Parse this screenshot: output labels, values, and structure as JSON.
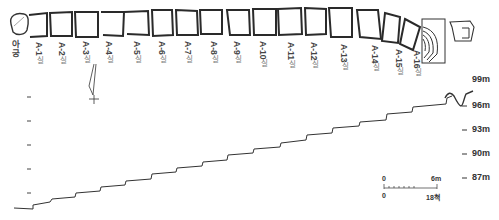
{
  "figure": {
    "type": "kiln plan and longitudinal section",
    "plan": {
      "firebox_label": "아궁",
      "chambers": [
        {
          "id": "A-1",
          "suffix": "실"
        },
        {
          "id": "A-2",
          "suffix": "실"
        },
        {
          "id": "A-3",
          "suffix": "실"
        },
        {
          "id": "A-4",
          "suffix": "실"
        },
        {
          "id": "A-5",
          "suffix": "실"
        },
        {
          "id": "A-6",
          "suffix": "실"
        },
        {
          "id": "A-7",
          "suffix": "실"
        },
        {
          "id": "A-8",
          "suffix": "실"
        },
        {
          "id": "A-9",
          "suffix": "실"
        },
        {
          "id": "A-10",
          "suffix": "실"
        },
        {
          "id": "A-11",
          "suffix": "실"
        },
        {
          "id": "A-12",
          "suffix": "실"
        },
        {
          "id": "A-13",
          "suffix": "실"
        },
        {
          "id": "A-14",
          "suffix": "실"
        },
        {
          "id": "A-15",
          "suffix": "실"
        },
        {
          "id": "A-16",
          "suffix": "실"
        }
      ]
    },
    "section": {
      "elevation_ticks": [
        "99m",
        "96m",
        "93m",
        "90m",
        "87m"
      ],
      "steps": 17
    },
    "scale_bar": {
      "top_start": "0",
      "top_end": "6m",
      "bottom_start": "0",
      "bottom_end": "18척"
    }
  }
}
